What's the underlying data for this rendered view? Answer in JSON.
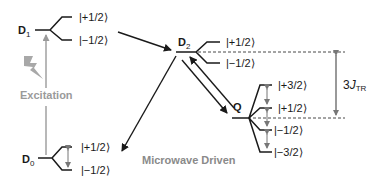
{
  "diagram": {
    "states": {
      "D1": {
        "label": "D",
        "sub": "1",
        "kets": [
          "|+1/2⟩",
          "|−1/2⟩"
        ]
      },
      "D2": {
        "label": "D",
        "sub": "2",
        "kets": [
          "|+1/2⟩",
          "|−1/2⟩"
        ]
      },
      "Q": {
        "label": "Q",
        "kets": [
          "|+3/2⟩",
          "|+1/2⟩",
          "|−1/2⟩",
          "|−3/2⟩"
        ]
      },
      "D0": {
        "label": "D",
        "sub": "0",
        "kets": [
          "|+1/2⟩",
          "|−1/2⟩"
        ]
      }
    },
    "excitation_label": "Excitation",
    "microwave_label": "Microwave Driven",
    "splitting": {
      "prefix": "3",
      "J": "J",
      "sub": "TR"
    },
    "colors": {
      "line": "#1a1a1a",
      "gray": "#9a9a9a",
      "arrow_gray": "#777777"
    }
  }
}
